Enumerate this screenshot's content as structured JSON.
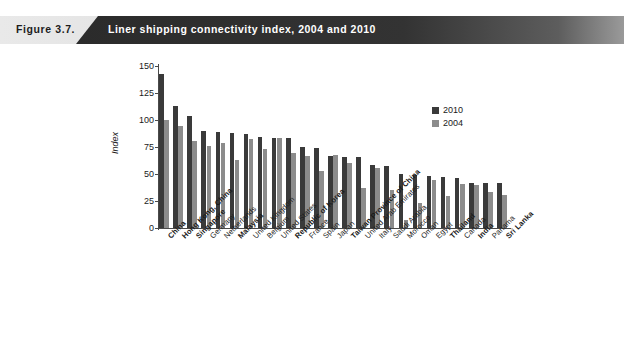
{
  "figure": {
    "number": "Figure 3.7.",
    "title": "Liner shipping connectivity index, 2004 and 2010"
  },
  "legend": {
    "position": "top-right",
    "entries": [
      {
        "label": "2010",
        "color": "#3a3a3a"
      },
      {
        "label": "2004",
        "color": "#8c8c8c"
      }
    ]
  },
  "axis": {
    "y_title": "Index",
    "y_ticks": [
      "0",
      "25",
      "50",
      "75",
      "100",
      "125",
      "150"
    ]
  },
  "chart_data": {
    "type": "bar",
    "title": "Liner shipping connectivity index, 2004 and 2010",
    "xlabel": "",
    "ylabel": "Index",
    "ylim": [
      0,
      150
    ],
    "ytick_step": 25,
    "grid": false,
    "legend_position": "top-right",
    "categories": [
      "China",
      "Hong Kong, China",
      "Singapore",
      "Germany",
      "Netherlands",
      "Malaysia",
      "United Kingdom",
      "Belgium",
      "United States",
      "Republic of Korea",
      "France",
      "Spain",
      "Japan",
      "Taiwan Province of China",
      "United Arab Emirates",
      "Italy",
      "Saudi Arabia",
      "Morocco",
      "Oman",
      "Egypt",
      "Thailand",
      "Canada",
      "India",
      "Panama",
      "Sri Lanka"
    ],
    "categories_emphasized": [
      "China",
      "Hong Kong, China",
      "Singapore",
      "Malaysia",
      "Republic of Korea",
      "Taiwan Province of China",
      "Thailand",
      "India",
      "Sri Lanka"
    ],
    "series": [
      {
        "name": "2010",
        "color": "#3a3a3a",
        "values": [
          143,
          113,
          104,
          90,
          89,
          88,
          87,
          84,
          83,
          83,
          75,
          74,
          67,
          66,
          66,
          58,
          57,
          50,
          49,
          48,
          47,
          46,
          42,
          42,
          42
        ]
      },
      {
        "name": "2004",
        "color": "#8c8c8c",
        "values": [
          100,
          94,
          81,
          76,
          79,
          63,
          82,
          73,
          83,
          69,
          67,
          53,
          68,
          60,
          37,
          56,
          35,
          7,
          23,
          44,
          30,
          41,
          40,
          33,
          31
        ]
      }
    ]
  }
}
